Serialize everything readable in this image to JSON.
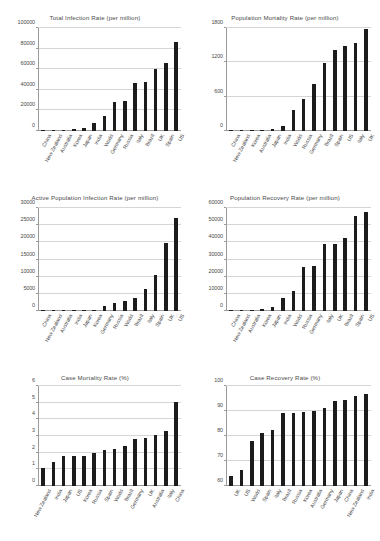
{
  "page": {
    "background": "#ffffff",
    "bar_color": "#1c1c1c",
    "grid_color": "#d5d5d5",
    "axis_color": "#9b9b9b",
    "text_color": "#4a4a4a"
  },
  "chart_data": [
    {
      "type": "bar",
      "title": "Total Infection Rate (per million)",
      "xlabel": "",
      "ylabel": "",
      "ylim": [
        0,
        100000
      ],
      "yticks": [
        0,
        20000,
        40000,
        60000,
        80000,
        100000
      ],
      "grid": true,
      "legend": "none",
      "categories": [
        "China",
        "New Zealand",
        "Australia",
        "Korea",
        "Japan",
        "India",
        "World",
        "Germany",
        "Russia",
        "Italy",
        "Brazil",
        "UK",
        "Spain",
        "US"
      ],
      "values": [
        100,
        400,
        900,
        1500,
        2600,
        7600,
        15000,
        28500,
        28800,
        46500,
        47500,
        60000,
        66500,
        86500
      ]
    },
    {
      "type": "bar",
      "title": "Population Mortality Rate (per million)",
      "xlabel": "",
      "ylabel": "",
      "ylim": [
        0,
        1800
      ],
      "yticks": [
        0,
        600,
        1200,
        1800
      ],
      "grid": true,
      "legend": "none",
      "categories": [
        "China",
        "New Zealand",
        "Korea",
        "Australia",
        "Japan",
        "India",
        "World",
        "Russia",
        "Germany",
        "Brazil",
        "Spain",
        "US",
        "Italy",
        "UK"
      ],
      "values": [
        3,
        5,
        20,
        25,
        40,
        95,
        370,
        560,
        820,
        1180,
        1420,
        1480,
        1540,
        1790
      ]
    },
    {
      "type": "bar",
      "title": "Active Population Infection Rate (per million)",
      "xlabel": "",
      "ylabel": "",
      "ylim": [
        0,
        30000
      ],
      "yticks": [
        0,
        5000,
        10000,
        15000,
        20000,
        25000,
        30000
      ],
      "grid": true,
      "legend": "none",
      "categories": [
        "China",
        "New Zealand",
        "Australia",
        "India",
        "Japan",
        "Korea",
        "Germany",
        "Russia",
        "World",
        "Brazil",
        "Italy",
        "Spain",
        "UK",
        "US"
      ],
      "values": [
        100,
        50,
        60,
        150,
        200,
        220,
        1400,
        2400,
        2900,
        3900,
        6400,
        10600,
        19800,
        27100
      ]
    },
    {
      "type": "bar",
      "title": "Population Recovery Rate (per million)",
      "xlabel": "",
      "ylabel": "",
      "ylim": [
        0,
        60000
      ],
      "yticks": [
        0,
        10000,
        20000,
        30000,
        40000,
        50000,
        60000
      ],
      "grid": true,
      "legend": "none",
      "categories": [
        "China",
        "New Zealand",
        "Australia",
        "Korea",
        "Japan",
        "India",
        "World",
        "Russia",
        "Germany",
        "Italy",
        "UK",
        "Brazil",
        "Spain",
        "US"
      ],
      "values": [
        500,
        350,
        800,
        1200,
        2300,
        7700,
        11500,
        25600,
        26100,
        38800,
        38800,
        42700,
        55300,
        57800
      ]
    },
    {
      "type": "bar",
      "title": "Case Mortality Rate (%)",
      "xlabel": "",
      "ylabel": "",
      "ylim": [
        0,
        6
      ],
      "yticks": [
        0,
        1,
        2,
        3,
        4,
        5,
        6
      ],
      "grid": true,
      "legend": "none",
      "categories": [
        "New Zealand",
        "India",
        "Japan",
        "US",
        "Korea",
        "Russia",
        "Spain",
        "World",
        "Brazil",
        "Germany",
        "UK",
        "Australia",
        "Italy",
        "China"
      ],
      "values": [
        1.1,
        1.43,
        1.78,
        1.78,
        1.78,
        2.0,
        2.15,
        2.2,
        2.38,
        2.85,
        2.9,
        3.08,
        3.33,
        5.07
      ]
    },
    {
      "type": "bar",
      "title": "Case Recovery Rate (%)",
      "xlabel": "",
      "ylabel": "",
      "ylim": [
        60,
        100
      ],
      "yticks": [
        60,
        70,
        80,
        90,
        100
      ],
      "grid": true,
      "legend": "none",
      "categories": [
        "UK",
        "US",
        "World",
        "Spain",
        "Italy",
        "Brazil",
        "Russia",
        "Korea",
        "Australia",
        "Germany",
        "Japan",
        "China",
        "New Zealand",
        "India"
      ],
      "values": [
        64.2,
        66.5,
        78.2,
        81.2,
        82.6,
        89.2,
        89.3,
        89.7,
        90.2,
        91.4,
        93.9,
        94.3,
        96.0,
        96.8
      ]
    }
  ]
}
